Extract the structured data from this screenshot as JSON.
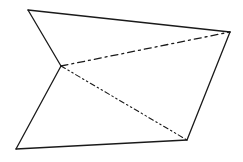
{
  "diagram": {
    "type": "geometric-line-drawing",
    "background": "#ffffff",
    "stroke_color": "#1a1a1a",
    "vertices": {
      "A": [
        28,
        10
      ],
      "B": [
        230,
        32
      ],
      "C": [
        61,
        66
      ],
      "D": [
        16,
        149
      ],
      "E": [
        187,
        140
      ]
    },
    "edges": [
      {
        "id": "A-B",
        "from": "A",
        "to": "B",
        "style": "solid",
        "width": 1.3
      },
      {
        "id": "A-C",
        "from": "A",
        "to": "C",
        "style": "solid",
        "width": 1.3
      },
      {
        "id": "C-D",
        "from": "C",
        "to": "D",
        "style": "solid",
        "width": 1.3
      },
      {
        "id": "D-E",
        "from": "D",
        "to": "E",
        "style": "solid",
        "width": 1.3
      },
      {
        "id": "E-B",
        "from": "E",
        "to": "B",
        "style": "solid",
        "width": 1.3
      },
      {
        "id": "C-B",
        "from": "C",
        "to": "B",
        "style": "dash-dot",
        "dasharray": "7 4 2 4",
        "width": 1.3
      },
      {
        "id": "C-E",
        "from": "C",
        "to": "E",
        "style": "dash-dot-dot",
        "dasharray": "5 3 1.5 3 1.5 3",
        "width": 1.1
      }
    ]
  }
}
